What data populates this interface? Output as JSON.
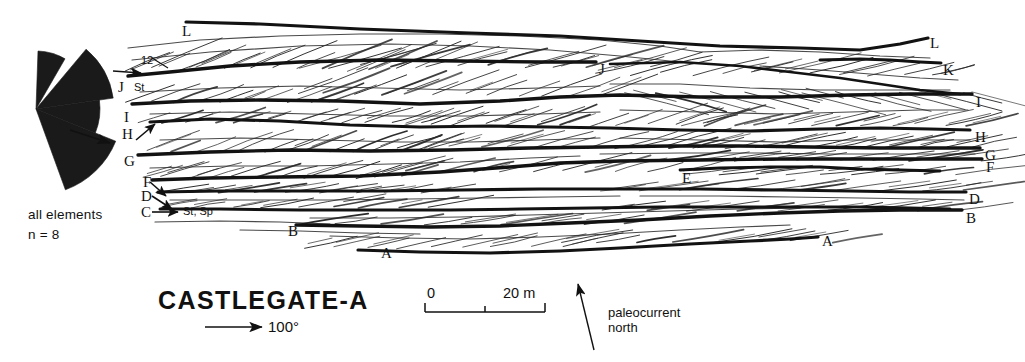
{
  "figure": {
    "title": "CASTLEGATE-A",
    "domain_kind": "geological-cross-section"
  },
  "rose_diagram": {
    "caption_line1": "all  elements",
    "caption_line2": "n = 8",
    "fill_color": "#1a1a1a",
    "center": {
      "x": 36,
      "y": 109
    },
    "wedges": [
      {
        "start_deg": 272,
        "end_deg": 300,
        "radius": 58,
        "label": "upper-spike"
      },
      {
        "start_deg": 310,
        "end_deg": 352,
        "radius": 78,
        "label": "main-upper"
      },
      {
        "start_deg": 352,
        "end_deg": 382,
        "radius": 64,
        "label": "main-right"
      },
      {
        "start_deg": 382,
        "end_deg": 430,
        "radius": 86,
        "label": "main-lower"
      }
    ],
    "mean_arrow": {
      "x1": 70,
      "y1": 130,
      "x2": 110,
      "y2": 143
    }
  },
  "left_labels": [
    {
      "text": "L",
      "x": 182,
      "y": 24
    },
    {
      "text": "J",
      "x": 118,
      "y": 80
    },
    {
      "text": "I",
      "x": 124,
      "y": 110
    },
    {
      "text": "H",
      "x": 122,
      "y": 127
    },
    {
      "text": "G",
      "x": 124,
      "y": 154
    },
    {
      "text": "F",
      "x": 143,
      "y": 175
    },
    {
      "text": "D",
      "x": 141,
      "y": 189
    },
    {
      "text": "C",
      "x": 141,
      "y": 205
    },
    {
      "text": "B",
      "x": 288,
      "y": 224
    },
    {
      "text": "A",
      "x": 381,
      "y": 246
    }
  ],
  "right_labels": [
    {
      "text": "L",
      "x": 930,
      "y": 36
    },
    {
      "text": "K",
      "x": 943,
      "y": 63
    },
    {
      "text": "I",
      "x": 976,
      "y": 95
    },
    {
      "text": "H",
      "x": 975,
      "y": 130
    },
    {
      "text": "G",
      "x": 985,
      "y": 148
    },
    {
      "text": "F",
      "x": 986,
      "y": 160
    },
    {
      "text": "D",
      "x": 969,
      "y": 192
    },
    {
      "text": "B",
      "x": 966,
      "y": 211
    },
    {
      "text": "A",
      "x": 822,
      "y": 234
    }
  ],
  "interior_labels": [
    {
      "text": "J",
      "x": 599,
      "y": 62
    },
    {
      "text": "E",
      "x": 682,
      "y": 171
    }
  ],
  "annotations": [
    {
      "name": "set-count-12",
      "text": "12",
      "x": 141,
      "y": 55,
      "kind": "small"
    },
    {
      "name": "lithofacies-st",
      "text": "St",
      "x": 134,
      "y": 82,
      "kind": "small"
    },
    {
      "name": "lithofacies-st-sp",
      "text": "St, Sp",
      "x": 183,
      "y": 206,
      "kind": "small"
    }
  ],
  "leader_lines": [
    {
      "name": "leader-12",
      "x1": 152,
      "y1": 58,
      "x2": 168,
      "y2": 68
    },
    {
      "name": "leader-j-arrow",
      "x1": 113,
      "y1": 71,
      "x2": 141,
      "y2": 73
    },
    {
      "name": "leader-h-arrow",
      "x1": 136,
      "y1": 140,
      "x2": 155,
      "y2": 124
    },
    {
      "name": "leader-f-arrow",
      "x1": 150,
      "y1": 182,
      "x2": 166,
      "y2": 196
    },
    {
      "name": "leader-d-arrow",
      "x1": 152,
      "y1": 196,
      "x2": 172,
      "y2": 209
    },
    {
      "name": "leader-c-arrow",
      "x1": 152,
      "y1": 212,
      "x2": 178,
      "y2": 212
    }
  ],
  "scale_bar": {
    "label_zero": "0",
    "label_max": "20 m",
    "x_start": 425,
    "x_end": 545,
    "y": 312,
    "tick_mid_x": 485
  },
  "azimuth": {
    "label": "100°",
    "arrow": {
      "x1": 205,
      "y1": 327,
      "x2": 262,
      "y2": 327
    },
    "label_x": 268,
    "label_y": 319
  },
  "north_indicator": {
    "caption_line1": "paleocurrent",
    "caption_line2": "north",
    "arrow": {
      "x1": 594,
      "y1": 350,
      "x2": 578,
      "y2": 284
    },
    "caption_x": 608,
    "caption_y": 306
  },
  "section_geometry": {
    "x_left": 118,
    "x_right": 965,
    "y_top": 18,
    "y_bottom": 258,
    "bounding_surface_color": "#121212",
    "lamina_color": "#2a2a2a",
    "bounding_surfaces": [
      {
        "id": "L",
        "thickness": 3.2,
        "points": "186,22 260,24 360,29 470,33 560,36 640,41 720,46 800,48 860,50 900,44 928,38"
      },
      {
        "id": "K",
        "thickness": 3.0,
        "points": "820,60 860,59 890,60 920,62 941,63"
      },
      {
        "id": "J",
        "thickness": 3.4,
        "points": "128,76 170,72 230,66 300,62 380,60 460,61 540,62 596,62"
      },
      {
        "id": "J2",
        "thickness": 2.6,
        "points": "610,64 680,62 740,66 790,72 840,78 880,84 920,90 960,94"
      },
      {
        "id": "I",
        "thickness": 3.4,
        "points": "132,104 190,101 260,100 340,101 420,104 500,101 560,97 620,95 700,97 780,97 850,95 910,94 972,94"
      },
      {
        "id": "H",
        "thickness": 3.2,
        "points": "150,122 210,119 280,121 350,125 420,127 490,126 550,127 610,128 680,130 750,131 820,129 880,128 930,129 970,130"
      },
      {
        "id": "G",
        "thickness": 3.4,
        "points": "138,155 210,152 290,150 370,151 450,150 530,148 600,147 670,146 740,146 810,147 880,148 930,148 980,148"
      },
      {
        "id": "F",
        "thickness": 3.3,
        "points": "152,180 210,178 280,177 360,176 440,172 510,167 560,163 620,161 700,160 780,159 850,159 910,159 982,159"
      },
      {
        "id": "E",
        "thickness": 2.8,
        "points": "680,170 720,168 770,167 820,167 860,169 900,170 940,171"
      },
      {
        "id": "D",
        "thickness": 3.2,
        "points": "158,192 220,191 300,191 380,191 460,190 540,189 620,189 700,189 780,190 850,191 910,192 966,192"
      },
      {
        "id": "C",
        "thickness": 3.0,
        "points": "160,209 220,209 300,210 380,210 450,210 520,209 590,208 660,207 730,207 800,207 860,207 910,208 950,209"
      },
      {
        "id": "B",
        "thickness": 3.3,
        "points": "296,225 360,226 430,227 500,226 570,223 640,220 710,216 780,213 840,211 900,210 962,210"
      },
      {
        "id": "A",
        "thickness": 3.2,
        "points": "358,250 420,252 490,253 560,251 620,248 690,244 750,241 790,239 818,237"
      }
    ],
    "lamina_sets": [
      {
        "name": "set-L-upper",
        "x0": 128,
        "x1": 420,
        "y_top": 30,
        "y_bot": 74,
        "dip_dx": 72,
        "dip_dy": -30,
        "count": 13,
        "width": 1.0
      },
      {
        "name": "set-L-mid",
        "x0": 300,
        "x1": 650,
        "y_top": 36,
        "y_bot": 70,
        "dip_dx": 86,
        "dip_dy": -24,
        "count": 12,
        "width": 1.0
      },
      {
        "name": "set-L-right",
        "x0": 600,
        "x1": 930,
        "y_top": 42,
        "y_bot": 78,
        "dip_dx": 90,
        "dip_dy": -22,
        "count": 12,
        "width": 1.0
      },
      {
        "name": "set-J-left",
        "x0": 126,
        "x1": 330,
        "y_top": 78,
        "y_bot": 104,
        "dip_dx": 56,
        "dip_dy": -20,
        "count": 10,
        "width": 1.0
      },
      {
        "name": "set-J-mid",
        "x0": 300,
        "x1": 600,
        "y_top": 66,
        "y_bot": 98,
        "dip_dx": 70,
        "dip_dy": -26,
        "count": 12,
        "width": 1.0
      },
      {
        "name": "set-J2-right",
        "x0": 620,
        "x1": 960,
        "y_top": 66,
        "y_bot": 96,
        "dip_dx": 84,
        "dip_dy": 22,
        "count": 12,
        "width": 1.0
      },
      {
        "name": "set-I-left",
        "x0": 135,
        "x1": 420,
        "y_top": 104,
        "y_bot": 124,
        "dip_dx": 52,
        "dip_dy": -16,
        "count": 12,
        "width": 1.0
      },
      {
        "name": "set-I-mid",
        "x0": 400,
        "x1": 700,
        "y_top": 100,
        "y_bot": 128,
        "dip_dx": 64,
        "dip_dy": -22,
        "count": 12,
        "width": 1.0
      },
      {
        "name": "set-I-right",
        "x0": 680,
        "x1": 968,
        "y_top": 98,
        "y_bot": 128,
        "dip_dx": 76,
        "dip_dy": -18,
        "count": 12,
        "width": 1.0
      },
      {
        "name": "set-H-left",
        "x0": 150,
        "x1": 420,
        "y_top": 124,
        "y_bot": 154,
        "dip_dx": 58,
        "dip_dy": -22,
        "count": 13,
        "width": 1.0
      },
      {
        "name": "set-H-mid",
        "x0": 400,
        "x1": 690,
        "y_top": 126,
        "y_bot": 150,
        "dip_dx": 66,
        "dip_dy": -18,
        "count": 12,
        "width": 1.0
      },
      {
        "name": "set-H-right",
        "x0": 670,
        "x1": 970,
        "y_top": 128,
        "y_bot": 150,
        "dip_dx": 72,
        "dip_dy": -16,
        "count": 12,
        "width": 1.0
      },
      {
        "name": "set-G-left",
        "x0": 140,
        "x1": 400,
        "y_top": 155,
        "y_bot": 180,
        "dip_dx": 60,
        "dip_dy": -18,
        "count": 12,
        "width": 1.0
      },
      {
        "name": "set-G-mid",
        "x0": 380,
        "x1": 680,
        "y_top": 150,
        "y_bot": 174,
        "dip_dx": 70,
        "dip_dy": -18,
        "count": 11,
        "width": 1.0
      },
      {
        "name": "set-G-right",
        "x0": 660,
        "x1": 978,
        "y_top": 147,
        "y_bot": 162,
        "dip_dx": 80,
        "dip_dy": -12,
        "count": 10,
        "width": 1.0
      },
      {
        "name": "set-F-left",
        "x0": 158,
        "x1": 420,
        "y_top": 181,
        "y_bot": 194,
        "dip_dx": 62,
        "dip_dy": -10,
        "count": 9,
        "width": 1.0
      },
      {
        "name": "set-E-right",
        "x0": 690,
        "x1": 955,
        "y_top": 162,
        "y_bot": 176,
        "dip_dx": 78,
        "dip_dy": -10,
        "count": 9,
        "width": 1.0
      },
      {
        "name": "set-D-left",
        "x0": 162,
        "x1": 430,
        "y_top": 193,
        "y_bot": 209,
        "dip_dx": 66,
        "dip_dy": -12,
        "count": 9,
        "width": 1.0
      },
      {
        "name": "set-D-right",
        "x0": 600,
        "x1": 962,
        "y_top": 176,
        "y_bot": 192,
        "dip_dx": 84,
        "dip_dy": -12,
        "count": 10,
        "width": 1.0
      },
      {
        "name": "set-C-lower",
        "x0": 300,
        "x1": 620,
        "y_top": 210,
        "y_bot": 226,
        "dip_dx": 76,
        "dip_dy": -12,
        "count": 9,
        "width": 1.0
      },
      {
        "name": "set-B-lower",
        "x0": 600,
        "x1": 960,
        "y_top": 196,
        "y_bot": 212,
        "dip_dx": 86,
        "dip_dy": -12,
        "count": 9,
        "width": 1.0
      },
      {
        "name": "set-A-left",
        "x0": 300,
        "x1": 560,
        "y_top": 227,
        "y_bot": 250,
        "dip_dx": 70,
        "dip_dy": -16,
        "count": 9,
        "width": 1.0
      },
      {
        "name": "set-A-right",
        "x0": 560,
        "x1": 830,
        "y_top": 222,
        "y_bot": 244,
        "dip_dx": 80,
        "dip_dy": -14,
        "count": 8,
        "width": 1.0
      }
    ],
    "extra_thin_surfaces": [
      {
        "points": "128,48 200,40 280,36 360,34 440,34 520,36 600,40 660,46 700,52",
        "width": 1.2
      },
      {
        "points": "132,60 210,52 300,46 390,44 470,46 550,50 620,56 680,62",
        "width": 1.2
      },
      {
        "points": "700,52 760,50 820,52 880,56 930,58",
        "width": 1.2
      },
      {
        "points": "760,66 820,70 870,74 920,78 958,80",
        "width": 1.2
      },
      {
        "points": "140,92 220,88 300,86 380,88 460,90 540,88 600,86",
        "width": 1.2
      },
      {
        "points": "610,84 680,84 750,88 820,90 890,90 950,90",
        "width": 1.2
      },
      {
        "points": "150,114 230,112 310,114 390,116 470,116 540,114 600,112",
        "width": 1.2
      },
      {
        "points": "620,110 700,112 780,114 850,112 920,110 968,110",
        "width": 1.2
      },
      {
        "points": "160,140 240,138 320,140 400,142 470,142 540,140 600,138",
        "width": 1.2
      },
      {
        "points": "620,138 700,140 780,142 850,140 920,140 970,140",
        "width": 1.2
      },
      {
        "points": "150,168 230,166 310,166 390,164 460,162 530,158 580,156",
        "width": 1.2
      },
      {
        "points": "600,154 680,153 760,153 830,154 900,154 975,154",
        "width": 1.2
      },
      {
        "points": "170,200 250,200 330,200 410,199 480,198 550,197 620,196",
        "width": 1.2
      },
      {
        "points": "640,196 720,196 790,197 860,198 920,199 964,200",
        "width": 1.2
      },
      {
        "points": "310,218 390,218 460,217 530,215 600,213 670,211 740,209 800,208",
        "width": 1.2
      },
      {
        "points": "330,236 400,238 470,239 540,237 610,234 680,230 740,227 790,225",
        "width": 1.2
      },
      {
        "points": "240,230 300,231 360,233 420,234",
        "width": 1.2
      },
      {
        "points": "155,222 220,221 280,222 330,224",
        "width": 1.2
      }
    ]
  }
}
